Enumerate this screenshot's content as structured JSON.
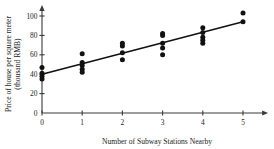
{
  "chart_data": {
    "type": "scatter",
    "title": "",
    "xlabel": "Number of Subway Stations Nearby",
    "ylabel": "Price of house per square meter (thousand RMB)",
    "ylabel_line1": "Price of house per square meter",
    "ylabel_line2": "(thousand RMB)",
    "xlim": [
      0,
      5.6
    ],
    "ylim": [
      0,
      104
    ],
    "xticks": [
      0,
      1,
      2,
      3,
      4,
      5
    ],
    "xtick_labels": [
      "0",
      "1",
      "2",
      "3",
      "4",
      "5"
    ],
    "yticks": [
      0,
      20,
      40,
      60,
      80,
      100
    ],
    "ytick_labels": [
      "0",
      "20",
      "40",
      "60",
      "80",
      "100"
    ],
    "grid": false,
    "legend": "none",
    "x_axis_arrow": true,
    "y_axis_arrow": true,
    "point_color": "#111111",
    "line_color": "#111111",
    "axis_color": "#3a3a3a",
    "points": [
      {
        "x": 0,
        "y": 47
      },
      {
        "x": 0,
        "y": 41
      },
      {
        "x": 0,
        "y": 38
      },
      {
        "x": 0,
        "y": 35
      },
      {
        "x": 1,
        "y": 61
      },
      {
        "x": 1,
        "y": 52
      },
      {
        "x": 1,
        "y": 49
      },
      {
        "x": 1,
        "y": 45
      },
      {
        "x": 1,
        "y": 42
      },
      {
        "x": 2,
        "y": 72
      },
      {
        "x": 2,
        "y": 69
      },
      {
        "x": 2,
        "y": 62
      },
      {
        "x": 2,
        "y": 55
      },
      {
        "x": 3,
        "y": 82
      },
      {
        "x": 3,
        "y": 80
      },
      {
        "x": 3,
        "y": 72
      },
      {
        "x": 3,
        "y": 67
      },
      {
        "x": 3,
        "y": 60
      },
      {
        "x": 4,
        "y": 88
      },
      {
        "x": 4,
        "y": 83
      },
      {
        "x": 4,
        "y": 78
      },
      {
        "x": 4,
        "y": 75
      },
      {
        "x": 4,
        "y": 72
      },
      {
        "x": 5,
        "y": 103
      },
      {
        "x": 5,
        "y": 94
      }
    ],
    "trend_line": {
      "label": "regression-line",
      "x_start": 0,
      "y_start": 40,
      "x_end": 5,
      "y_end": 94,
      "slope": 10.8,
      "intercept": 40
    }
  }
}
